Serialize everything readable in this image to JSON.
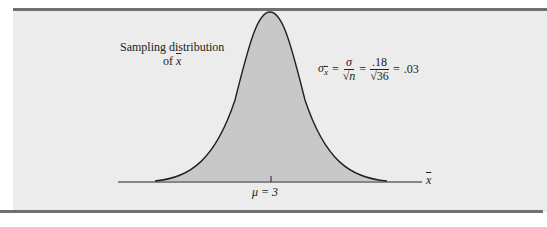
{
  "figure": {
    "curve_label_line1": "Sampling distribution",
    "curve_label_line2_prefix": "of ",
    "curve_label_var": "x",
    "formula": {
      "lhs": "σ",
      "lhs_sub": "x",
      "eq1": "=",
      "frac1_num": "σ",
      "frac1_den": "√n",
      "eq2": "=",
      "frac2_num": ".18",
      "frac2_den": "√36",
      "eq3": "=",
      "result": ".03"
    },
    "mean_label": "μ = 3",
    "axis_label": "x"
  },
  "colors": {
    "panel_bg": "#ececec",
    "curve_fill": "#c8c8c8",
    "rule": "#707070",
    "ink": "#222222"
  }
}
